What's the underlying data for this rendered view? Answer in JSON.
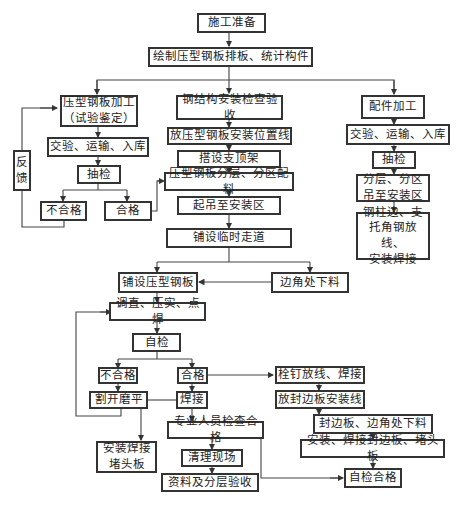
{
  "nodes": {
    "prep": "施工准备",
    "drawing": "绘制压型钢板排板、统计构件",
    "sheet_processing": "压型钢板加工\n（试验鉴定）",
    "steel_acceptance": "钢结构安装检查验收",
    "fittings_processing": "配件加工",
    "left_receive": "交验、运输、入库",
    "left_sample": "抽检",
    "left_fail": "不合格",
    "left_pass": "合格",
    "feedback": "反\n馈",
    "layout_line": "放压型钢板安装位置线",
    "support": "搭设支顶架",
    "zone_material": "压型钢板分层、分区配料",
    "hoist": "起吊至安装区",
    "walkway": "铺设临时走道",
    "right_receive": "交验、运输、入库",
    "right_sample": "抽检",
    "right_zone": "分层、分区\n吊至安装区",
    "right_column": "钢柱边、支\n托角钢放线、\n安装焊接",
    "lay_sheet": "铺设压型钢板",
    "corner_cut": "边角处下料",
    "straighten": "调直、压实、点焊",
    "self_check": "自检",
    "mid_fail": "不合格",
    "mid_pass": "合格",
    "cut_grind": "割开磨平",
    "weld": "焊接",
    "install_end": "安装焊接\n堵头板",
    "pro_check": "专业人员检查合格",
    "cleanup": "清理现场",
    "docs": "资料及分层验收",
    "stud": "栓钉放线、焊接",
    "edge_line": "放封边板安装线",
    "edge_cut": "封边板、边角处下料",
    "edge_install": "安装、焊接封边板、堵头板",
    "self_pass": "自检合格"
  }
}
